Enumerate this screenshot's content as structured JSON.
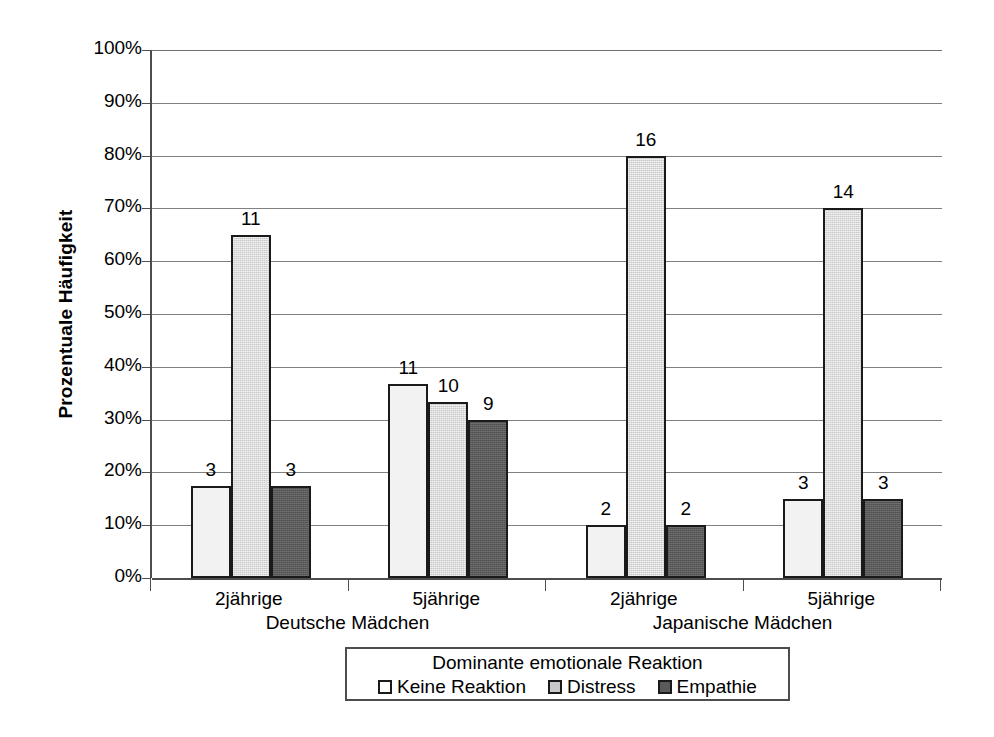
{
  "chart_data": {
    "type": "bar",
    "title": "",
    "xlabel": "",
    "ylabel": "Prozentuale Häufigkeit",
    "ylim": [
      0,
      100
    ],
    "grid": true,
    "legend_position": "bottom",
    "legend_title": "Dominante emotionale Reaktion",
    "y_ticks": [
      "0%",
      "10%",
      "20%",
      "30%",
      "40%",
      "50%",
      "60%",
      "70%",
      "80%",
      "90%",
      "100%"
    ],
    "y_tick_values": [
      0,
      10,
      20,
      30,
      40,
      50,
      60,
      70,
      80,
      90,
      100
    ],
    "categories": [
      "2jährige",
      "5jährige",
      "2jährige",
      "5jährige"
    ],
    "supergroups": [
      {
        "label": "Deutsche Mädchen",
        "categories": [
          "2jährige",
          "5jährige"
        ]
      },
      {
        "label": "Japanische Mädchen",
        "categories": [
          "2jährige",
          "5jährige"
        ]
      }
    ],
    "series": [
      {
        "name": "Keine Reaktion",
        "color": "#f2f2f2",
        "values": [
          17.5,
          36.7,
          10.0,
          15.0
        ],
        "counts": [
          3,
          11,
          2,
          3
        ],
        "labels": [
          "3",
          "11",
          "2",
          "3"
        ]
      },
      {
        "name": "Distress",
        "color": "#c9c9c9",
        "values": [
          65.0,
          33.3,
          80.0,
          70.0
        ],
        "counts": [
          11,
          10,
          16,
          14
        ],
        "labels": [
          "11",
          "10",
          "16",
          "14"
        ]
      },
      {
        "name": "Empathie",
        "color": "#5a5a5a",
        "values": [
          17.5,
          30.0,
          10.0,
          15.0
        ],
        "counts": [
          3,
          9,
          2,
          3
        ],
        "labels": [
          "3",
          "9",
          "2",
          "3"
        ]
      }
    ]
  }
}
